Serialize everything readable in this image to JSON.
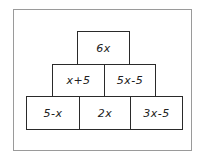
{
  "title": "",
  "pyramid": {
    "rows": [
      {
        "cells": [
          {
            "label": "6x"
          }
        ]
      },
      {
        "cells": [
          {
            "label": "x+5"
          },
          {
            "label": "5x-5"
          }
        ]
      },
      {
        "cells": [
          {
            "label": "5-x"
          },
          {
            "label": "2x"
          },
          {
            "label": "3x-5"
          }
        ]
      }
    ]
  },
  "colors": {
    "border": "#2a2a2a",
    "frame": "#9a9a9a",
    "text": "#222222",
    "background": "#ffffff"
  }
}
